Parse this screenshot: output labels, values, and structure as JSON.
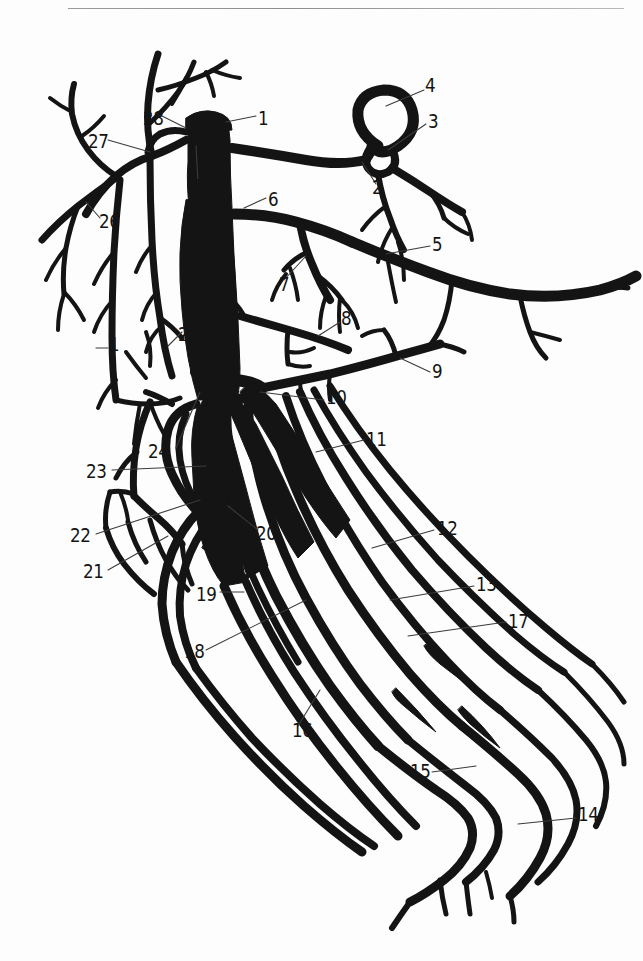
{
  "page": {
    "background_color": "#fdfdfd",
    "ink_color": "#141414",
    "rule_color": "#9a9a9a",
    "running_head": ""
  },
  "figure": {
    "title": "",
    "kind": "anatomical line illustration",
    "style": "solid black ink silhouette on white",
    "label_count": 28
  },
  "labels": [
    {
      "id": "28",
      "text": "28",
      "x": 143,
      "y": 119,
      "anchor": "left"
    },
    {
      "id": "1a",
      "text": "1",
      "x": 258,
      "y": 119,
      "anchor": "left"
    },
    {
      "id": "27",
      "text": "27",
      "x": 88,
      "y": 142,
      "anchor": "left"
    },
    {
      "id": "1b",
      "text": "1",
      "x": 193,
      "y": 187,
      "anchor": "left"
    },
    {
      "id": "6",
      "text": "6",
      "x": 268,
      "y": 200,
      "anchor": "left"
    },
    {
      "id": "26",
      "text": "26",
      "x": 99,
      "y": 222,
      "anchor": "left"
    },
    {
      "id": "4",
      "text": "4",
      "x": 425,
      "y": 86,
      "anchor": "left"
    },
    {
      "id": "3",
      "text": "3",
      "x": 428,
      "y": 122,
      "anchor": "left"
    },
    {
      "id": "2",
      "text": "2",
      "x": 372,
      "y": 188,
      "anchor": "left"
    },
    {
      "id": "5",
      "text": "5",
      "x": 432,
      "y": 245,
      "anchor": "left"
    },
    {
      "id": "7",
      "text": "7",
      "x": 279,
      "y": 285,
      "anchor": "left"
    },
    {
      "id": "8",
      "text": "8",
      "x": 341,
      "y": 319,
      "anchor": "left"
    },
    {
      "id": "9",
      "text": "9",
      "x": 432,
      "y": 372,
      "anchor": "left"
    },
    {
      "id": "1c",
      "text": "1",
      "x": 109,
      "y": 345,
      "anchor": "left"
    },
    {
      "id": "25",
      "text": "25",
      "x": 178,
      "y": 335,
      "anchor": "left"
    },
    {
      "id": "10",
      "text": "10",
      "x": 326,
      "y": 398,
      "anchor": "left"
    },
    {
      "id": "24",
      "text": "24",
      "x": 148,
      "y": 452,
      "anchor": "left"
    },
    {
      "id": "11",
      "text": "11",
      "x": 366,
      "y": 440,
      "anchor": "left"
    },
    {
      "id": "23",
      "text": "23",
      "x": 86,
      "y": 472,
      "anchor": "left"
    },
    {
      "id": "12",
      "text": "12",
      "x": 437,
      "y": 529,
      "anchor": "left"
    },
    {
      "id": "22",
      "text": "22",
      "x": 70,
      "y": 536,
      "anchor": "left"
    },
    {
      "id": "20",
      "text": "20",
      "x": 256,
      "y": 534,
      "anchor": "left"
    },
    {
      "id": "21",
      "text": "21",
      "x": 83,
      "y": 572,
      "anchor": "left"
    },
    {
      "id": "13",
      "text": "13",
      "x": 476,
      "y": 585,
      "anchor": "left"
    },
    {
      "id": "19",
      "text": "19",
      "x": 196,
      "y": 595,
      "anchor": "left"
    },
    {
      "id": "17",
      "text": "17",
      "x": 508,
      "y": 622,
      "anchor": "left"
    },
    {
      "id": "18",
      "text": "18",
      "x": 184,
      "y": 652,
      "anchor": "left"
    },
    {
      "id": "16",
      "text": "16",
      "x": 292,
      "y": 731,
      "anchor": "left"
    },
    {
      "id": "15",
      "text": "15",
      "x": 410,
      "y": 772,
      "anchor": "left"
    },
    {
      "id": "14",
      "text": "14",
      "x": 578,
      "y": 815,
      "anchor": "left"
    }
  ]
}
